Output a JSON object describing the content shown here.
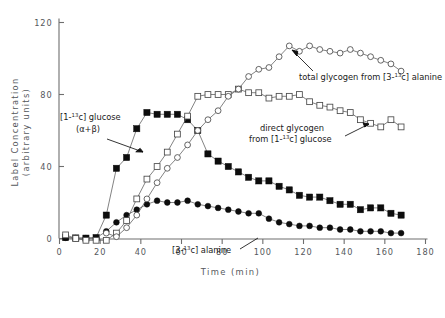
{
  "chart_data": {
    "type": "line",
    "title": "",
    "xlabel": "Time  (min)",
    "ylabel": "Label Concentration (arbitrary units)",
    "xlim": [
      0,
      180
    ],
    "ylim": [
      0,
      120
    ],
    "xticks": [
      0,
      20,
      40,
      60,
      80,
      100,
      120,
      140,
      160,
      180
    ],
    "yticks": [
      0,
      40,
      80,
      120
    ],
    "grid": false,
    "legend_position": "inline-annotations",
    "series": [
      {
        "name": "[1-13c] glucose (α+β)",
        "marker": "filled-square",
        "x": [
          3,
          8,
          13,
          18,
          23,
          28,
          33,
          38,
          43,
          48,
          53,
          58,
          63,
          68,
          73,
          78,
          83,
          88,
          93,
          98,
          103,
          108,
          113,
          118,
          123,
          128,
          133,
          138,
          143,
          148,
          153,
          158,
          163,
          168
        ],
        "y": [
          0.5,
          0.3,
          0.2,
          0.5,
          13,
          39,
          45,
          61,
          70,
          69,
          69,
          69,
          66,
          60,
          47,
          43,
          40,
          37,
          34,
          32,
          32,
          29,
          27,
          24,
          23,
          23,
          21,
          19,
          19,
          16,
          17,
          17,
          14,
          13
        ]
      },
      {
        "name": "[3-13c] alanine",
        "marker": "filled-circle",
        "x": [
          3,
          8,
          13,
          18,
          23,
          28,
          33,
          38,
          43,
          48,
          53,
          58,
          63,
          68,
          73,
          78,
          83,
          88,
          93,
          98,
          103,
          108,
          113,
          118,
          123,
          128,
          133,
          138,
          143,
          148,
          153,
          158,
          163,
          168
        ],
        "y": [
          0.4,
          0.2,
          0.2,
          0.3,
          4,
          9,
          13,
          16,
          19,
          21,
          20,
          20,
          21,
          19,
          18,
          17,
          16,
          15,
          14,
          14,
          11,
          9,
          8,
          7,
          7,
          6,
          6,
          5,
          5,
          4,
          4,
          4,
          3,
          3
        ]
      },
      {
        "name": "direct glycogen from [1-13c] glucose",
        "marker": "open-square",
        "x": [
          3,
          8,
          13,
          18,
          23,
          28,
          33,
          38,
          43,
          48,
          53,
          58,
          63,
          68,
          73,
          78,
          83,
          88,
          93,
          98,
          103,
          108,
          113,
          118,
          123,
          128,
          133,
          138,
          143,
          148,
          153,
          158,
          163,
          168
        ],
        "y": [
          2,
          0,
          -1,
          -1,
          -1,
          3,
          10,
          22,
          33,
          40,
          48,
          58,
          68,
          79,
          80,
          80,
          80,
          83,
          81,
          81,
          78,
          79,
          79,
          80,
          76,
          74,
          73,
          71,
          70,
          66,
          64,
          62,
          66,
          62
        ]
      },
      {
        "name": "total glycogen from [3-13c] alanine",
        "marker": "open-circle",
        "x": [
          23,
          28,
          33,
          38,
          43,
          48,
          53,
          58,
          63,
          68,
          73,
          78,
          83,
          88,
          93,
          98,
          103,
          108,
          113,
          118,
          123,
          128,
          133,
          138,
          143,
          148,
          153,
          158,
          163,
          168
        ],
        "y": [
          3,
          1,
          6,
          13,
          22,
          31,
          39,
          45,
          52,
          60,
          66,
          71,
          79,
          83,
          90,
          94,
          95,
          101,
          107,
          104,
          107,
          105,
          104,
          103,
          105,
          103,
          101,
          99,
          97,
          93
        ]
      }
    ],
    "annotations": [
      {
        "id": "annot-glucose",
        "line1_pre": "[1-",
        "line1_sup": "13",
        "line1_post": "c] glucose",
        "line2": "(α+β)"
      },
      {
        "id": "annot-total-glycogen",
        "pre": "total glycogen from [3-",
        "sup": "13",
        "post": "c] alanine"
      },
      {
        "id": "annot-direct-glycogen",
        "line1": "direct glycogen",
        "line2_pre": "from [1-",
        "line2_sup": "13",
        "line2_post": "c] glucose"
      },
      {
        "id": "annot-alanine",
        "pre": "[3-",
        "sup": "13",
        "post": "c] alanine"
      }
    ]
  },
  "axis": {
    "x_title": "Time  (min)",
    "y_title_line1": "Label Concentration",
    "y_title_line2": "(arbitrary units)",
    "xtick_labels": [
      "0",
      "20",
      "40",
      "60",
      "80",
      "100",
      "120",
      "140",
      "160",
      "180"
    ],
    "ytick_labels": [
      "0",
      "40",
      "80",
      "120"
    ]
  },
  "colors": {
    "axis": "#6e6e6e",
    "tick_text": "#55585c",
    "series_line": "#5a5a5a",
    "marker_filled": "#0d0d0d",
    "marker_open_stroke": "#4a4a4a",
    "annotation_text": "#1a1a1a",
    "background": "#ffffff"
  }
}
